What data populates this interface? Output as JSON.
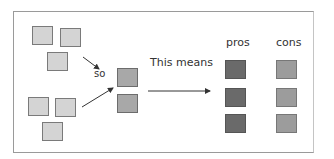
{
  "labels": {
    "so": "so",
    "this_means": "This means",
    "pros": "pros",
    "cons": "cons"
  },
  "colors": {
    "light_square": "#d4d4d4",
    "mid_square": "#a8a8a8",
    "pros_square": "#6a6a6a",
    "cons_square": "#9c9c9c",
    "frame": "#9a9a9a",
    "arrow": "#333333"
  },
  "groups": {
    "top_left_count": 3,
    "bottom_left_count": 3,
    "middle_count": 2,
    "pros_count": 3,
    "cons_count": 3
  }
}
